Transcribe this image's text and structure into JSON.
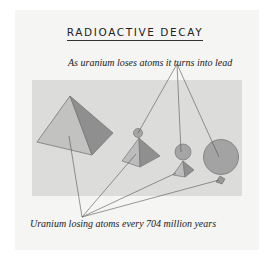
{
  "title": "RADIOACTIVE DECAY",
  "caption_top": "As uranium loses atoms it turns into lead",
  "caption_bottom": "Uranium losing atoms every 704 million years",
  "colors": {
    "panel": "#dcdcda",
    "pyramid_light": "#b9b9b9",
    "pyramid_dark": "#8d8d8d",
    "sphere": "#a3a3a3",
    "line": "#555555"
  }
}
